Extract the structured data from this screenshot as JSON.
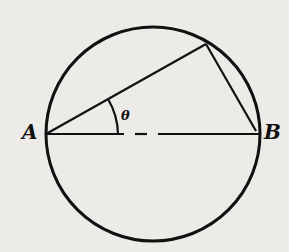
{
  "diagram": {
    "type": "geometry",
    "labels": {
      "point_a": "A",
      "point_b": "B",
      "angle": "θ"
    },
    "colors": {
      "background": "#ecebe8",
      "stroke": "#111111"
    }
  }
}
